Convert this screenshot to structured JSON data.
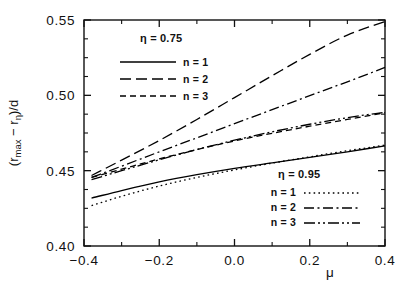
{
  "chart_data": {
    "type": "line",
    "title": "",
    "xlabel": "μ",
    "ylabel": "(r_max − r_η)/d",
    "ylabel_parts": {
      "open": "(r",
      "sub1": "max",
      "minus": " − r",
      "sub2": "η",
      "close": ")/d"
    },
    "xlim": [
      -0.4,
      0.4
    ],
    "ylim": [
      0.4,
      0.55
    ],
    "xticks": [
      -0.4,
      -0.2,
      0.0,
      0.2,
      0.4
    ],
    "xticklabels": [
      "-0.4",
      "-0.2",
      "0.0",
      "0.2",
      "0.4"
    ],
    "yticks": [
      0.4,
      0.45,
      0.5,
      0.55
    ],
    "yticklabels": [
      "0.40",
      "0.45",
      "0.50",
      "0.55"
    ],
    "xminor_step": 0.1,
    "yminor_step": 0.0125,
    "grid": false,
    "ticks_direction": "in",
    "legend_position": [
      "upper-left-inside",
      "lower-right-inside"
    ],
    "series": [
      {
        "name": "eta=0.75, n=1",
        "eta": 0.75,
        "n": 1,
        "dash": "solid",
        "label": "n = 1",
        "x": [
          -0.38,
          -0.3,
          -0.2,
          -0.1,
          0.0,
          0.1,
          0.2,
          0.3,
          0.4
        ],
        "y": [
          0.4318,
          0.4368,
          0.4425,
          0.4473,
          0.4515,
          0.4552,
          0.4588,
          0.4625,
          0.4665
        ]
      },
      {
        "name": "eta=0.75, n=2",
        "eta": 0.75,
        "n": 2,
        "dash": "long-dash",
        "label": "n = 2",
        "x": [
          -0.38,
          -0.3,
          -0.2,
          -0.1,
          0.0,
          0.1,
          0.2,
          0.3,
          0.4
        ],
        "y": [
          0.4468,
          0.457,
          0.47,
          0.484,
          0.4985,
          0.513,
          0.5272,
          0.54,
          0.549
        ]
      },
      {
        "name": "eta=0.75, n=3",
        "eta": 0.75,
        "n": 3,
        "dash": "short-dash",
        "label": "n = 3",
        "x": [
          -0.38,
          -0.3,
          -0.2,
          -0.1,
          0.0,
          0.1,
          0.2,
          0.3,
          0.4
        ],
        "y": [
          0.4455,
          0.451,
          0.4578,
          0.464,
          0.4697,
          0.4748,
          0.4795,
          0.484,
          0.4885
        ]
      },
      {
        "name": "eta=0.95, n=1",
        "eta": 0.95,
        "n": 1,
        "dash": "dotted",
        "label": "n = 1",
        "x": [
          -0.38,
          -0.3,
          -0.2,
          -0.1,
          0.0,
          0.1,
          0.2,
          0.3,
          0.4
        ],
        "y": [
          0.4268,
          0.433,
          0.4398,
          0.4455,
          0.4505,
          0.455,
          0.4592,
          0.4632,
          0.467
        ]
      },
      {
        "name": "eta=0.95, n=2",
        "eta": 0.95,
        "n": 2,
        "dash": "dash-dot",
        "label": "n = 2",
        "x": [
          -0.38,
          -0.3,
          -0.2,
          -0.1,
          0.0,
          0.1,
          0.2,
          0.3,
          0.4
        ],
        "y": [
          0.4455,
          0.453,
          0.4625,
          0.4718,
          0.4812,
          0.4905,
          0.4998,
          0.509,
          0.5185
        ]
      },
      {
        "name": "eta=0.95, n=3",
        "eta": 0.95,
        "n": 3,
        "dash": "dash-dot-dot",
        "label": "n = 3",
        "x": [
          -0.38,
          -0.3,
          -0.2,
          -0.1,
          0.0,
          0.1,
          0.2,
          0.3,
          0.4
        ],
        "y": [
          0.444,
          0.45,
          0.4572,
          0.464,
          0.4702,
          0.4758,
          0.4808,
          0.4852,
          0.4888
        ]
      }
    ],
    "legends": [
      {
        "id": "legend-eta-075",
        "header": "η = 0.75",
        "eta_symbol": "η",
        "eta_value": "0.75",
        "entries": [
          {
            "label": "n = 1",
            "dash": "solid"
          },
          {
            "label": "n = 2",
            "dash": "long-dash"
          },
          {
            "label": "n = 3",
            "dash": "short-dash"
          }
        ]
      },
      {
        "id": "legend-eta-095",
        "header": "η = 0.95",
        "eta_symbol": "η",
        "eta_value": "0.95",
        "entries": [
          {
            "label": "n = 1",
            "dash": "dotted"
          },
          {
            "label": "n = 2",
            "dash": "dash-dot"
          },
          {
            "label": "n = 3",
            "dash": "dash-dot-dot"
          }
        ]
      }
    ],
    "colors": {
      "line": "#000000",
      "axis": "#111111",
      "background": "#ffffff"
    }
  }
}
